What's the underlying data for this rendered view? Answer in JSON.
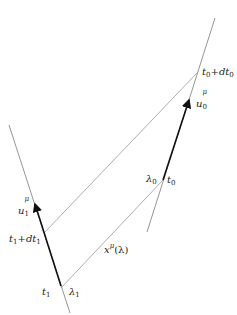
{
  "diagram": {
    "colors": {
      "thin_line": "#7a7a7a",
      "thick_line": "#111111",
      "text": "#222222"
    },
    "worldlines": {
      "right": {
        "x1": 147,
        "y1": 232,
        "x2": 215,
        "y2": 18
      },
      "left": {
        "x1": 9,
        "y1": 125,
        "x2": 70,
        "y2": 313
      }
    },
    "velocity_segments": {
      "u0": {
        "x1": 163,
        "y1": 180,
        "x2": 189,
        "y2": 100
      },
      "u1": {
        "x1": 61,
        "y1": 286,
        "x2": 35,
        "y2": 204
      }
    },
    "connectors": {
      "upper": {
        "x1": 44,
        "y1": 233,
        "x2": 197,
        "y2": 73
      },
      "lower": {
        "x1": 61,
        "y1": 288,
        "x2": 163,
        "y2": 180
      }
    },
    "labels": {
      "t0_plus_dt0": {
        "base": "t",
        "sub": "0",
        "plus": "+",
        "d": "dt",
        "sub2": "0"
      },
      "u0": {
        "base": "u",
        "sup": "μ",
        "sub": "0"
      },
      "lambda0": {
        "base": "λ",
        "sub": "0"
      },
      "t0": {
        "base": "t",
        "sub": "0"
      },
      "u1": {
        "base": "u",
        "sup": "μ",
        "sub": "1"
      },
      "t1_plus_dt1": {
        "base": "t",
        "sub": "1",
        "plus": "+",
        "d": "dt",
        "sub2": "1"
      },
      "x_lambda": {
        "base": "x",
        "sup": "μ",
        "arg": "(λ)"
      },
      "t1": {
        "base": "t",
        "sub": "1"
      },
      "lambda1": {
        "base": "λ",
        "sub": "1"
      }
    }
  }
}
